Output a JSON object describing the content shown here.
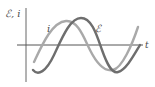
{
  "diagram": {
    "title": "",
    "y_axis_label": "ℰ, i",
    "x_axis_label": "t",
    "curves": [
      {
        "name": "current",
        "label": "i",
        "color": "#a9a9a9"
      },
      {
        "name": "emf",
        "label": "ℰ",
        "color": "#6e6e6e"
      }
    ],
    "axis_color": "#555555"
  }
}
